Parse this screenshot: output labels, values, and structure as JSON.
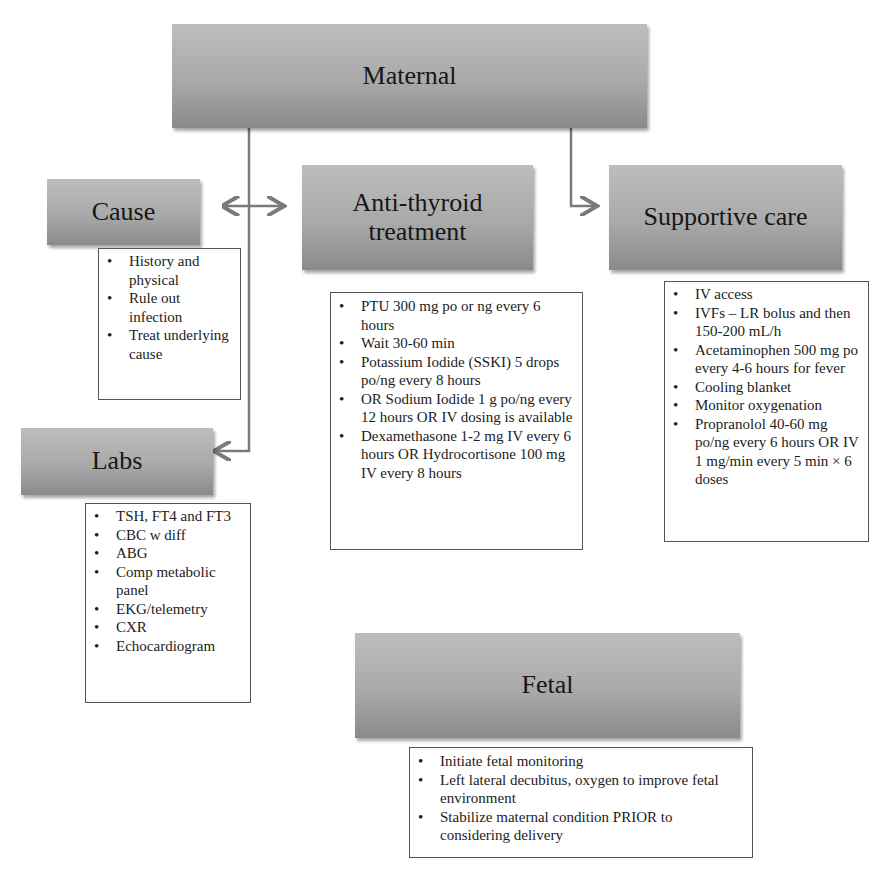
{
  "diagram": {
    "maternal": {
      "label": "Maternal"
    },
    "cause": {
      "label": "Cause",
      "items": [
        "History and physical",
        "Rule out infection",
        "Treat underlying cause"
      ]
    },
    "antithyroid": {
      "label_line1": "Anti-thyroid",
      "label_line2": "treatment",
      "items": [
        "PTU 300 mg po or ng every 6 hours",
        "Wait 30-60 min",
        "Potassium Iodide (SSKI) 5 drops po/ng every 8 hours",
        "OR Sodium Iodide 1 g po/ng every 12 hours OR IV dosing is available",
        "Dexamethasone 1-2 mg IV every 6 hours OR Hydrocortisone 100 mg IV every 8 hours"
      ]
    },
    "supportive": {
      "label": "Supportive care",
      "items": [
        "IV access",
        "IVFs – LR bolus and then 150-200 mL/h",
        "Acetaminophen 500 mg po every 4-6 hours for fever",
        "Cooling blanket",
        "Monitor oxygenation",
        "Propranolol 40-60 mg po/ng every 6 hours OR IV 1 mg/min every 5 min × 6 doses"
      ]
    },
    "labs": {
      "label": "Labs",
      "items": [
        "TSH, FT4 and FT3",
        "CBC w diff",
        "ABG",
        "Comp metabolic panel",
        "EKG/telemetry",
        "CXR",
        "Echocardiogram"
      ]
    },
    "fetal": {
      "label": "Fetal",
      "items": [
        "Initiate fetal monitoring",
        "Left lateral decubitus, oxygen to improve fetal environment",
        "Stabilize maternal condition PRIOR to considering delivery"
      ]
    },
    "colors": {
      "header_fill_top": "#bdbdbd",
      "header_fill_bottom": "#8a8a8a",
      "connector": "#7a7a7a",
      "text": "#1a1a1a"
    }
  }
}
